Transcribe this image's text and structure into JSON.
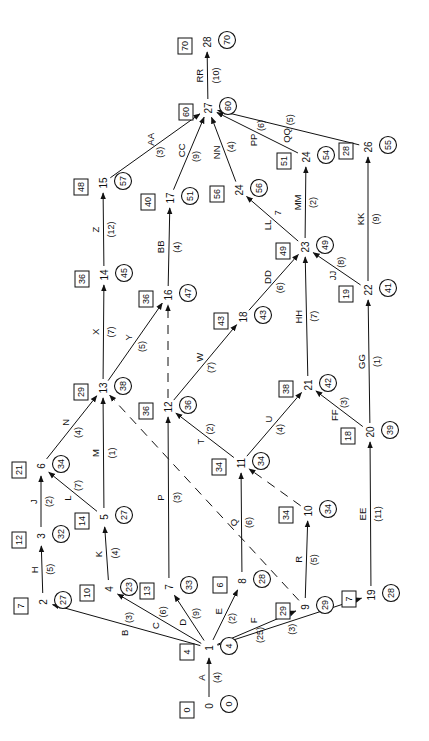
{
  "diagram": {
    "type": "activity-on-arrow network",
    "orientation": "rotated-90-ccw",
    "legend": {
      "square": "earliest time",
      "circle": "latest time"
    },
    "nodes": [
      {
        "id": "0",
        "x": 209,
        "y": 706,
        "early": "0",
        "late": "0"
      },
      {
        "id": "1",
        "x": 209,
        "y": 648,
        "early": "4",
        "late": "4"
      },
      {
        "id": "2",
        "x": 43,
        "y": 602,
        "early": "7",
        "late": "27"
      },
      {
        "id": "3",
        "x": 41,
        "y": 536,
        "early": "12",
        "late": "32"
      },
      {
        "id": "4",
        "x": 109,
        "y": 589,
        "early": "10",
        "late": "23"
      },
      {
        "id": "5",
        "x": 104,
        "y": 517,
        "early": "14",
        "late": "27"
      },
      {
        "id": "6",
        "x": 41,
        "y": 466,
        "early": "21",
        "late": "34"
      },
      {
        "id": "7",
        "x": 169,
        "y": 587,
        "early": "13",
        "late": "33"
      },
      {
        "id": "8",
        "x": 242,
        "y": 581,
        "early": "6",
        "late": "28"
      },
      {
        "id": "9",
        "x": 305,
        "y": 607,
        "early": "29",
        "late": "29"
      },
      {
        "id": "10",
        "x": 308,
        "y": 511,
        "early": "34",
        "late": "34"
      },
      {
        "id": "11",
        "x": 241,
        "y": 463,
        "early": "34",
        "late": "34"
      },
      {
        "id": "12",
        "x": 168,
        "y": 407,
        "early": "36",
        "late": "36"
      },
      {
        "id": "13",
        "x": 103,
        "y": 388,
        "early": "29",
        "late": "38"
      },
      {
        "id": "14",
        "x": 104,
        "y": 275,
        "early": "36",
        "late": "45"
      },
      {
        "id": "15",
        "x": 103,
        "y": 183,
        "early": "48",
        "late": "57"
      },
      {
        "id": "16",
        "x": 168,
        "y": 295,
        "early": "36",
        "late": "47"
      },
      {
        "id": "17",
        "x": 170,
        "y": 198,
        "early": "40",
        "late": "51"
      },
      {
        "id": "18",
        "x": 243,
        "y": 317,
        "early": "43",
        "late": "43"
      },
      {
        "id": "19",
        "x": 371,
        "y": 595,
        "early": "7",
        "late": "28"
      },
      {
        "id": "20",
        "x": 370,
        "y": 432,
        "early": "18",
        "late": "39"
      },
      {
        "id": "21",
        "x": 308,
        "y": 385,
        "early": "38",
        "late": "42"
      },
      {
        "id": "22",
        "x": 368,
        "y": 290,
        "early": "19",
        "late": "41"
      },
      {
        "id": "23",
        "x": 305,
        "y": 247,
        "early": "49",
        "late": "49"
      },
      {
        "id": "24",
        "x": 239,
        "y": 190,
        "early": "56",
        "late": "56"
      },
      {
        "id": "24",
        "x": 306,
        "y": 157,
        "early": "51",
        "late": "54"
      },
      {
        "id": "26",
        "x": 368,
        "y": 147,
        "early": "28",
        "late": "55"
      },
      {
        "id": "27",
        "x": 208,
        "y": 108,
        "early": "60",
        "late": "60"
      },
      {
        "id": "28",
        "x": 207,
        "y": 42,
        "early": "70",
        "late": "70"
      }
    ],
    "edges": [
      {
        "label": "A",
        "duration": "(4)",
        "from": 0,
        "to": 1,
        "dummy": false
      },
      {
        "label": "B",
        "duration": "(3)",
        "from": 1,
        "to": 2,
        "dummy": false
      },
      {
        "label": "C",
        "duration": "(6)",
        "from": 1,
        "to": 4,
        "dummy": false
      },
      {
        "label": "D",
        "duration": "(9)",
        "from": 1,
        "to": 7,
        "dummy": false
      },
      {
        "label": "E",
        "duration": "(2)",
        "from": 1,
        "to": 8,
        "dummy": false
      },
      {
        "label": "F",
        "duration": "(25)",
        "from": 1,
        "to": 9,
        "dummy": false
      },
      {
        "label": "G",
        "duration": "(3)",
        "from": 1,
        "to": 19,
        "dummy": false
      },
      {
        "label": "H",
        "duration": "(5)",
        "from": 2,
        "to": 3,
        "dummy": false
      },
      {
        "label": "J",
        "duration": "(2)",
        "from": 3,
        "to": 6,
        "dummy": false
      },
      {
        "label": "K",
        "duration": "(4)",
        "from": 4,
        "to": 5,
        "dummy": false
      },
      {
        "label": "L",
        "duration": "(7)",
        "from": 5,
        "to": 6,
        "dummy": false
      },
      {
        "label": "M",
        "duration": "(1)",
        "from": 5,
        "to": 13,
        "dummy": false
      },
      {
        "label": "N",
        "duration": "(4)",
        "from": 6,
        "to": 13,
        "dummy": false
      },
      {
        "label": "P",
        "duration": "(3)",
        "from": 7,
        "to": 12,
        "dummy": false
      },
      {
        "label": "Q",
        "duration": "(6)",
        "from": 8,
        "to": 11,
        "dummy": false
      },
      {
        "label": "R",
        "duration": "(5)",
        "from": 9,
        "to": 10,
        "dummy": false
      },
      {
        "label": "",
        "duration": "",
        "from": 9,
        "to": 13,
        "dummy": true
      },
      {
        "label": "",
        "duration": "",
        "from": 10,
        "to": 11,
        "dummy": true
      },
      {
        "label": "T",
        "duration": "(2)",
        "from": 11,
        "to": 12,
        "dummy": false
      },
      {
        "label": "U",
        "duration": "(4)",
        "from": 11,
        "to": 21,
        "dummy": false
      },
      {
        "label": "",
        "duration": "",
        "from": 12,
        "to": 16,
        "dummy": true
      },
      {
        "label": "W",
        "duration": "(7)",
        "from": 12,
        "to": 18,
        "dummy": false
      },
      {
        "label": "X",
        "duration": "(7)",
        "from": 13,
        "to": 14,
        "dummy": false
      },
      {
        "label": "Y",
        "duration": "(5)",
        "from": 13,
        "to": 16,
        "dummy": false
      },
      {
        "label": "Z",
        "duration": "(12)",
        "from": 14,
        "to": 15,
        "dummy": false
      },
      {
        "label": "AA",
        "duration": "(3)",
        "from": 15,
        "to": 27,
        "dummy": false
      },
      {
        "label": "BB",
        "duration": "(4)",
        "from": 16,
        "to": 17,
        "dummy": false
      },
      {
        "label": "CC",
        "duration": "(9)",
        "from": 17,
        "to": 27,
        "dummy": false
      },
      {
        "label": "DD",
        "duration": "(6)",
        "from": 18,
        "to": 23,
        "dummy": false
      },
      {
        "label": "EE",
        "duration": "(11)",
        "from": 19,
        "to": 20,
        "dummy": false
      },
      {
        "label": "FF",
        "duration": "(3)",
        "from": 20,
        "to": 21,
        "dummy": false
      },
      {
        "label": "GG",
        "duration": "(1)",
        "from": 20,
        "to": 22,
        "dummy": false
      },
      {
        "label": "HH",
        "duration": "(7)",
        "from": 21,
        "to": 23,
        "dummy": false
      },
      {
        "label": "JJ",
        "duration": "(8)",
        "from": 22,
        "to": 23,
        "dummy": false
      },
      {
        "label": "KK",
        "duration": "(9)",
        "from": 22,
        "to": 26,
        "dummy": false
      },
      {
        "label": "LL",
        "duration": "7",
        "from": 23,
        "to": 24,
        "dummy": false
      },
      {
        "label": "MM",
        "duration": "(2)",
        "from": 23,
        "to": 25,
        "dummy": false
      },
      {
        "label": "NN",
        "duration": "(4)",
        "from": 24,
        "to": 27,
        "dummy": false
      },
      {
        "label": "PP",
        "duration": "(6)",
        "from": 25,
        "to": 27,
        "dummy": false
      },
      {
        "label": "QQ",
        "duration": "(5)",
        "from": 26,
        "to": 27,
        "dummy": false
      },
      {
        "label": "RR",
        "duration": "(10)",
        "from": 27,
        "to": 28,
        "dummy": false
      }
    ]
  }
}
